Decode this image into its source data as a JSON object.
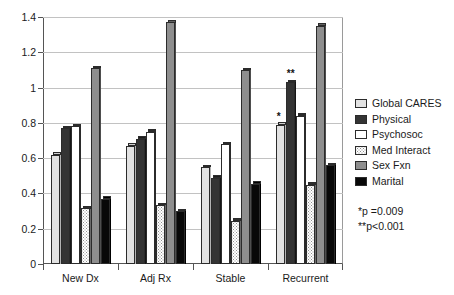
{
  "chart_data": {
    "type": "bar",
    "title": "",
    "subtitle": "",
    "xlabel": "",
    "ylabel": "",
    "ylim": [
      0,
      1.4
    ],
    "ytick_labels": [
      "0",
      "0.2",
      "0.4",
      "0.6",
      "0.8",
      "1",
      "1.2",
      "1.4"
    ],
    "ytick_values": [
      0,
      0.2,
      0.4,
      0.6,
      0.8,
      1.0,
      1.2,
      1.4
    ],
    "grid": true,
    "legend_position": "right",
    "categories": [
      "New Dx",
      "Adj Rx",
      "Stable",
      "Recurrent"
    ],
    "series": [
      {
        "name": "Global CARES",
        "color": "#e2e2e2",
        "values": [
          0.62,
          0.67,
          0.55,
          0.79
        ]
      },
      {
        "name": "Physical",
        "color": "#343434",
        "values": [
          0.77,
          0.71,
          0.49,
          1.03
        ]
      },
      {
        "name": "Psychosoc",
        "color": "#ffffff",
        "values": [
          0.78,
          0.75,
          0.68,
          0.84
        ]
      },
      {
        "name": "Med Interact",
        "color": "#ffffff",
        "values": [
          0.315,
          0.335,
          0.245,
          0.45
        ]
      },
      {
        "name": "Sex Fxn",
        "color": "#8e8e8e",
        "values": [
          1.11,
          1.37,
          1.1,
          1.35
        ]
      },
      {
        "name": "Marital",
        "color": "#080808",
        "values": [
          0.37,
          0.3,
          0.455,
          0.56
        ]
      }
    ],
    "annotations": [
      {
        "text": "*",
        "category": "Recurrent",
        "series": "Global CARES"
      },
      {
        "text": "**",
        "category": "Recurrent",
        "series": "Physical"
      }
    ],
    "notes": [
      "*p =0.009",
      "**p<0.001"
    ]
  },
  "legend": {
    "items": [
      {
        "label": "Global CARES",
        "swatch": "swatch-global-cares"
      },
      {
        "label": "Physical",
        "swatch": "swatch-physical"
      },
      {
        "label": "Psychosoc",
        "swatch": "swatch-psychosoc"
      },
      {
        "label": "Med Interact",
        "swatch": "swatch-med-interact"
      },
      {
        "label": "Sex Fxn",
        "swatch": "swatch-sex-fxn"
      },
      {
        "label": "Marital",
        "swatch": "swatch-marital"
      }
    ]
  },
  "footnotes": {
    "single_star": "*p =0.009",
    "double_star": "**p<0.001"
  }
}
